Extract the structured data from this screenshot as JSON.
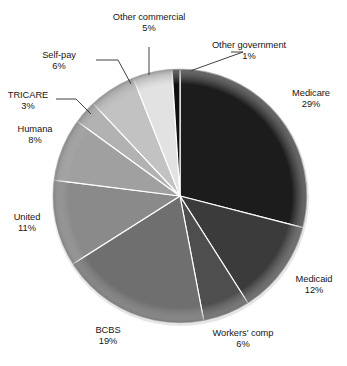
{
  "chart_data": {
    "type": "pie",
    "title": "",
    "subtitle": "",
    "xlabel": "",
    "ylabel": "",
    "legend_position": "none",
    "labels_placement": "outside-with-leader-lines",
    "grid": false,
    "start_angle_deg": 0,
    "direction": "clockwise",
    "units": "percent",
    "categories": [
      "Medicare",
      "Medicaid",
      "Workers' comp",
      "BCBS",
      "United",
      "Humana",
      "TRICARE",
      "Self-pay",
      "Other commercial",
      "Other government"
    ],
    "values": [
      29,
      12,
      6,
      19,
      11,
      8,
      3,
      6,
      5,
      1
    ],
    "value_labels": [
      "29%",
      "12%",
      "6%",
      "19%",
      "11%",
      "8%",
      "3%",
      "6%",
      "5%",
      "1%"
    ],
    "slice_colors": [
      "#1c1c1c",
      "#3b3b3b",
      "#4e4e4e",
      "#6f6f6f",
      "#8a8a8a",
      "#a0a0a0",
      "#b2b2b2",
      "#c2c2c2",
      "#e2e2e2",
      "#101010"
    ],
    "slices": [
      {
        "label": "Medicare",
        "value": 29,
        "value_label": "29%",
        "color": "#1c1c1c"
      },
      {
        "label": "Medicaid",
        "value": 12,
        "value_label": "12%",
        "color": "#3b3b3b"
      },
      {
        "label": "Workers' comp",
        "value": 6,
        "value_label": "6%",
        "color": "#4e4e4e"
      },
      {
        "label": "BCBS",
        "value": 19,
        "value_label": "19%",
        "color": "#6f6f6f"
      },
      {
        "label": "United",
        "value": 11,
        "value_label": "11%",
        "color": "#8a8a8a"
      },
      {
        "label": "Humana",
        "value": 8,
        "value_label": "8%",
        "color": "#a0a0a0"
      },
      {
        "label": "TRICARE",
        "value": 3,
        "value_label": "3%",
        "color": "#b2b2b2"
      },
      {
        "label": "Self-pay",
        "value": 6,
        "value_label": "6%",
        "color": "#c2c2c2"
      },
      {
        "label": "Other commercial",
        "value": 5,
        "value_label": "5%",
        "color": "#e2e2e2"
      },
      {
        "label": "Other government",
        "value": 1,
        "value_label": "1%",
        "color": "#101010"
      }
    ],
    "total": 100
  },
  "labels": {
    "medicare": {
      "name": "Medicare",
      "pct": "29%"
    },
    "medicaid": {
      "name": "Medicaid",
      "pct": "12%"
    },
    "workers_comp": {
      "name": "Workers' comp",
      "pct": "6%"
    },
    "bcbs": {
      "name": "BCBS",
      "pct": "19%"
    },
    "united": {
      "name": "United",
      "pct": "11%"
    },
    "humana": {
      "name": "Humana",
      "pct": "8%"
    },
    "tricare": {
      "name": "TRICARE",
      "pct": "3%"
    },
    "selfpay": {
      "name": "Self-pay",
      "pct": "6%"
    },
    "other_commercial": {
      "name": "Other commercial",
      "pct": "5%"
    },
    "other_government": {
      "name": "Other government",
      "pct": "1%"
    }
  },
  "style": {
    "background": "#ffffff",
    "text_color": "#161616",
    "separator_color": "#ffffff",
    "leader_line_color": "#2a2a2a"
  }
}
